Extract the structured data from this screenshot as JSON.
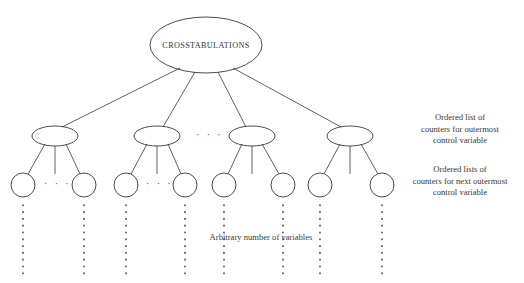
{
  "diagram": {
    "type": "tree",
    "title_node": {
      "label": "CROSSTABULATIONS",
      "shape": "ellipse",
      "cx": 206,
      "cy": 45,
      "rx": 56,
      "ry": 28
    },
    "level2_nodes": [
      {
        "label": "",
        "shape": "ellipse",
        "cx": 55,
        "cy": 136,
        "rx": 23,
        "ry": 10
      },
      {
        "label": "",
        "shape": "ellipse",
        "cx": 157,
        "cy": 136,
        "rx": 23,
        "ry": 10
      },
      {
        "label": "",
        "shape": "ellipse",
        "cx": 252,
        "cy": 136,
        "rx": 23,
        "ry": 10
      },
      {
        "label": "",
        "shape": "ellipse",
        "cx": 350,
        "cy": 136,
        "rx": 23,
        "ry": 10
      }
    ],
    "level3_nodes": [
      {
        "label": "",
        "shape": "circle",
        "cx": 23,
        "cy": 185,
        "r": 12
      },
      {
        "label": "",
        "shape": "circle",
        "cx": 84,
        "cy": 185,
        "r": 12
      },
      {
        "label": "",
        "shape": "circle",
        "cx": 126,
        "cy": 185,
        "r": 12
      },
      {
        "label": "",
        "shape": "circle",
        "cx": 185,
        "cy": 185,
        "r": 12
      },
      {
        "label": "",
        "shape": "circle",
        "cx": 224,
        "cy": 185,
        "r": 12
      },
      {
        "label": "",
        "shape": "circle",
        "cx": 283,
        "cy": 185,
        "r": 12
      },
      {
        "label": "",
        "shape": "circle",
        "cx": 320,
        "cy": 185,
        "r": 12
      },
      {
        "label": "",
        "shape": "circle",
        "cx": 382,
        "cy": 185,
        "r": 12
      }
    ],
    "horizontal_ellipses": [
      {
        "name": "between-level2-nodes",
        "text": "· · ·",
        "x": 196,
        "y": 130
      },
      {
        "name": "between-circles-group1",
        "text": "· · ·",
        "x": 45,
        "y": 179
      },
      {
        "name": "between-circles-group2",
        "text": "· · ·",
        "x": 146,
        "y": 179
      }
    ],
    "vertical_dotted_columns": [
      23,
      84,
      126,
      185,
      224,
      283,
      320,
      382
    ],
    "annotations": [
      {
        "name": "outermost",
        "text": "Ordered list of\ncounters for outermost\ncontrol variable"
      },
      {
        "name": "next-outermost",
        "text": "Ordered lists of\ncounters for next outermost\ncontrol variable"
      }
    ],
    "caption": "Arbitrary number of variables",
    "colors": {
      "stroke": "#3a3836",
      "text": "#33312f",
      "background": "#ffffff"
    }
  }
}
